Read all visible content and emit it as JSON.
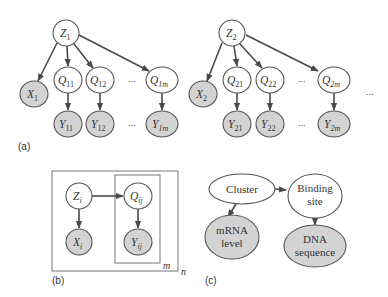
{
  "panels": {
    "a": {
      "label": "(a)",
      "groups": [
        {
          "root": {
            "base": "Z",
            "sub": "1"
          },
          "observed": {
            "base": "X",
            "sub": "1"
          },
          "hidden": [
            {
              "base": "Q",
              "sub": "11"
            },
            {
              "base": "Q",
              "sub": "12"
            },
            {
              "base": "Q",
              "sub": "1m"
            }
          ],
          "leaves": [
            {
              "base": "Y",
              "sub": "11"
            },
            {
              "base": "Y",
              "sub": "12"
            },
            {
              "base": "Y",
              "sub": "1m"
            }
          ],
          "ellipsis": "..."
        },
        {
          "root": {
            "base": "Z",
            "sub": "2"
          },
          "observed": {
            "base": "X",
            "sub": "2"
          },
          "hidden": [
            {
              "base": "Q",
              "sub": "21"
            },
            {
              "base": "Q",
              "sub": "22"
            },
            {
              "base": "Q",
              "sub": "2m"
            }
          ],
          "leaves": [
            {
              "base": "Y",
              "sub": "21"
            },
            {
              "base": "Y",
              "sub": "22"
            },
            {
              "base": "Y",
              "sub": "2m"
            }
          ],
          "ellipsis": "..."
        }
      ],
      "trailing_ellipsis": "..."
    },
    "b": {
      "label": "(b)",
      "nodes": {
        "Z": {
          "base": "Z",
          "sub": "i"
        },
        "Q": {
          "base": "Q",
          "sub": "ij"
        },
        "X": {
          "base": "X",
          "sub": "i"
        },
        "Y": {
          "base": "Y",
          "sub": "ij"
        }
      },
      "inner_plate": "m",
      "outer_plate": "n"
    },
    "c": {
      "label": "(c)",
      "nodes": {
        "cluster": [
          "Cluster"
        ],
        "binding": [
          "Binding",
          "site"
        ],
        "mrna": [
          "mRNA",
          "level"
        ],
        "dna": [
          "DNA",
          "sequence"
        ]
      }
    }
  },
  "colors": {
    "observed_fill": "#d3d3d3",
    "hidden_fill": "#ffffff",
    "stroke": "#555555",
    "edge": "#4a4a4a"
  }
}
